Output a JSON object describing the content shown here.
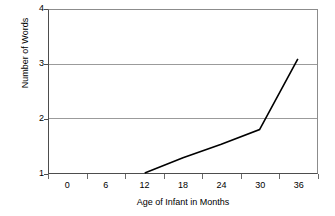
{
  "chart_data": {
    "type": "line",
    "title": "",
    "xlabel": "Age of Infant in Months",
    "ylabel": "Number of Words",
    "xlim": [
      -3,
      39
    ],
    "ylim": [
      1,
      4
    ],
    "x_ticks": [
      0,
      6,
      12,
      18,
      24,
      30,
      36
    ],
    "x_tick_labels": [
      "0",
      "6",
      "12",
      "18",
      "24",
      "30",
      "36"
    ],
    "y_ticks": [
      1,
      2,
      3,
      4
    ],
    "y_tick_labels": [
      "1",
      "2",
      "3",
      "4"
    ],
    "grid": "horizontal",
    "legend": "none",
    "series": [
      {
        "name": "Number of Words",
        "color": "#000000",
        "line_width": 1.6,
        "x": [
          12,
          18,
          24,
          30,
          36
        ],
        "values": [
          1.0,
          1.28,
          1.53,
          1.8,
          3.1
        ]
      }
    ]
  },
  "axes": {
    "y_title": "Number of Words",
    "x_title": "Age of Infant in Months",
    "y_labels": [
      "4",
      "3",
      "2",
      "1"
    ],
    "x_labels": [
      "0",
      "6",
      "12",
      "18",
      "24",
      "30",
      "36"
    ]
  },
  "colors": {
    "series_line": "#000000",
    "gridline": "#9a9a9a",
    "axis": "#4d4d4d",
    "frame": "#8c8c8c",
    "background": "#ffffff",
    "text": "#000000"
  }
}
